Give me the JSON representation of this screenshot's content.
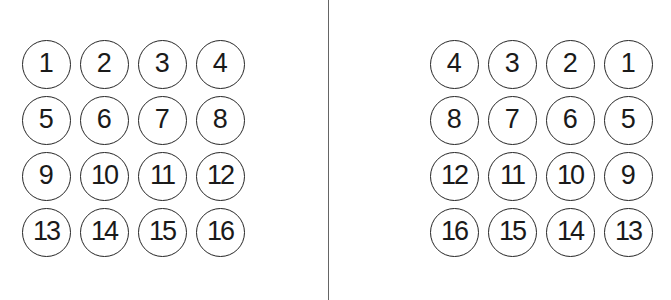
{
  "figure": {
    "background_color": "#ffffff",
    "stroke_color": "#262626",
    "text_color": "#1a1a1a",
    "divider_color": "#4a4a4a"
  },
  "divider": {
    "name": "vertical-divider-line",
    "x": 328,
    "top": 0,
    "height": 300
  },
  "panels": [
    {
      "id": "left-panel",
      "name": "left-circle-grid",
      "origin_x": 17,
      "origin_y": 36,
      "rows": 4,
      "cols": 4,
      "order": "left-to-right",
      "tokens": [
        "1",
        "2",
        "3",
        "4",
        "5",
        "6",
        "7",
        "8",
        "9",
        "10",
        "11",
        "12",
        "13",
        "14",
        "15",
        "16"
      ]
    },
    {
      "id": "right-panel",
      "name": "right-circle-grid",
      "origin_x": 425,
      "origin_y": 36,
      "rows": 4,
      "cols": 4,
      "order": "right-to-left",
      "tokens": [
        "4",
        "3",
        "2",
        "1",
        "8",
        "7",
        "6",
        "5",
        "12",
        "11",
        "10",
        "9",
        "16",
        "15",
        "14",
        "13"
      ]
    }
  ]
}
